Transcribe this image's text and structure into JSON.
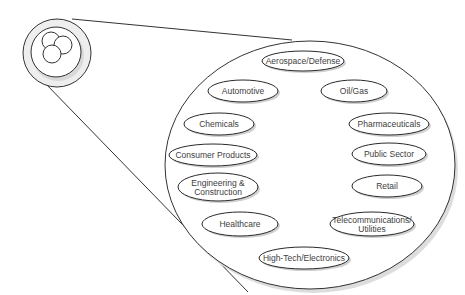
{
  "diagram": {
    "icon": {
      "name": "three-circles-logo"
    },
    "colors": {
      "stroke": "#2a2a2a",
      "text": "#404040",
      "shadow": "#cfcfcf",
      "background": "#ffffff"
    },
    "industries": [
      {
        "label": "Aerospace/Defense",
        "cx": 303,
        "cy": 61,
        "rx": 41,
        "ry": 10
      },
      {
        "label": "Automotive",
        "cx": 243,
        "cy": 91,
        "rx": 35,
        "ry": 11
      },
      {
        "label": "Oil/Gas",
        "cx": 354,
        "cy": 91,
        "rx": 33,
        "ry": 11
      },
      {
        "label": "Chemicals",
        "cx": 219,
        "cy": 124,
        "rx": 35,
        "ry": 11
      },
      {
        "label": "Pharmaceuticals",
        "cx": 389,
        "cy": 124,
        "rx": 40,
        "ry": 11
      },
      {
        "label": "Consumer Products",
        "cx": 213,
        "cy": 155,
        "rx": 44,
        "ry": 11
      },
      {
        "label": "Public Sector",
        "cx": 389,
        "cy": 154,
        "rx": 37,
        "ry": 11
      },
      {
        "label": "Engineering &",
        "label2": "Construction",
        "cx": 218,
        "cy": 187,
        "rx": 40,
        "ry": 14
      },
      {
        "label": "Retail",
        "cx": 387,
        "cy": 186,
        "rx": 35,
        "ry": 11
      },
      {
        "label": "Healthcare",
        "cx": 240,
        "cy": 224,
        "rx": 38,
        "ry": 12
      },
      {
        "label": "Telecommunications/",
        "label2": "Utilities",
        "cx": 372,
        "cy": 224,
        "rx": 42,
        "ry": 12
      },
      {
        "label": "High-Tech/Electronics",
        "cx": 304,
        "cy": 258,
        "rx": 45,
        "ry": 11
      }
    ]
  }
}
